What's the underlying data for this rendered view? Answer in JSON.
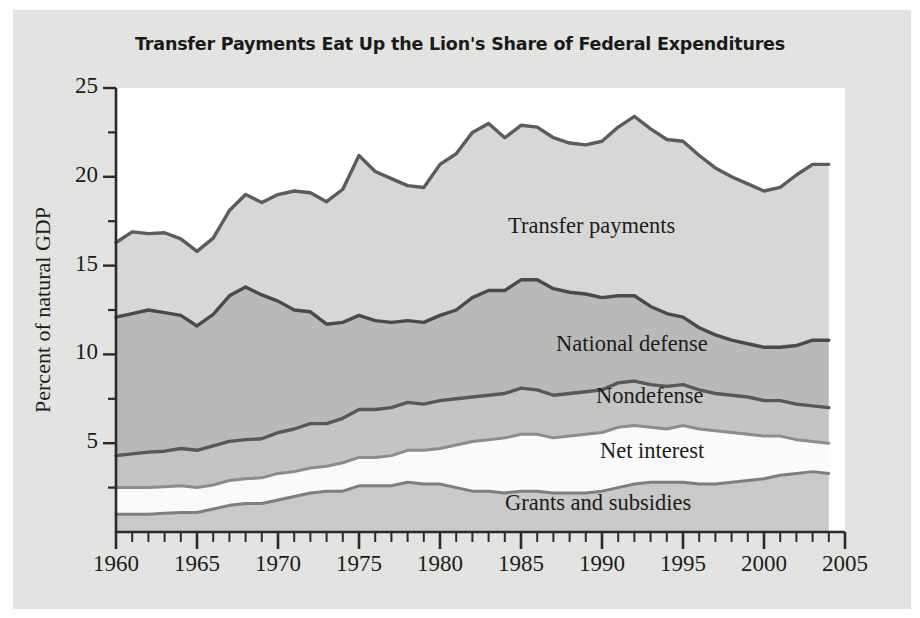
{
  "figure": {
    "title": "Transfer Payments Eat Up the Lion's Share of Federal Expenditures"
  },
  "axes": {
    "ylabel": "Percent of natural GDP",
    "yticks": [
      "5",
      "10",
      "15",
      "20",
      "25"
    ],
    "xticks": [
      "1960",
      "1965",
      "1970",
      "1975",
      "1980",
      "1985",
      "1990",
      "1995",
      "2000",
      "2005"
    ]
  },
  "series_labels": {
    "transfer": "Transfer payments",
    "defense": "National defense",
    "nondefense": "Nondefense",
    "interest": "Net interest",
    "grants": "Grants and subsidies"
  },
  "chart_data": {
    "type": "area",
    "title": "Transfer Payments Eat Up the Lion's Share of Federal Expenditures",
    "xlabel": "",
    "ylabel": "Percent of natural GDP",
    "xlim": [
      1960,
      2005
    ],
    "ylim": [
      0,
      25
    ],
    "grid": false,
    "legend": "inline-labels",
    "stacked": true,
    "x": [
      1960,
      1961,
      1962,
      1963,
      1964,
      1965,
      1966,
      1967,
      1968,
      1969,
      1970,
      1971,
      1972,
      1973,
      1974,
      1975,
      1976,
      1977,
      1978,
      1979,
      1980,
      1981,
      1982,
      1983,
      1984,
      1985,
      1986,
      1987,
      1988,
      1989,
      1990,
      1991,
      1992,
      1993,
      1994,
      1995,
      1996,
      1997,
      1998,
      1999,
      2000,
      2001,
      2002,
      2003,
      2004
    ],
    "series": [
      {
        "name": "Grants and subsidies",
        "order": 1,
        "color": "#c9c9c7",
        "line_color": "#7e7e7e",
        "values": [
          1.0,
          1.0,
          1.0,
          1.05,
          1.1,
          1.1,
          1.3,
          1.5,
          1.6,
          1.6,
          1.8,
          2.0,
          2.2,
          2.3,
          2.3,
          2.6,
          2.6,
          2.6,
          2.8,
          2.7,
          2.7,
          2.5,
          2.3,
          2.3,
          2.2,
          2.3,
          2.3,
          2.2,
          2.2,
          2.2,
          2.3,
          2.5,
          2.7,
          2.8,
          2.8,
          2.8,
          2.7,
          2.7,
          2.8,
          2.9,
          3.0,
          3.2,
          3.3,
          3.4,
          3.3
        ]
      },
      {
        "name": "Net interest",
        "order": 2,
        "color": "#fafafa",
        "line_color": "#8c8c8c",
        "values": [
          1.5,
          1.5,
          1.5,
          1.5,
          1.5,
          1.4,
          1.35,
          1.4,
          1.4,
          1.45,
          1.5,
          1.4,
          1.4,
          1.4,
          1.6,
          1.6,
          1.6,
          1.7,
          1.8,
          1.9,
          2.0,
          2.4,
          2.8,
          2.9,
          3.1,
          3.2,
          3.2,
          3.1,
          3.2,
          3.3,
          3.3,
          3.4,
          3.3,
          3.1,
          3.0,
          3.2,
          3.1,
          3.0,
          2.8,
          2.6,
          2.4,
          2.2,
          1.9,
          1.7,
          1.7
        ]
      },
      {
        "name": "Nondefense",
        "order": 3,
        "color": "#c4c4c2",
        "line_color": "#585858",
        "values": [
          1.8,
          1.9,
          2.0,
          2.0,
          2.1,
          2.1,
          2.2,
          2.2,
          2.2,
          2.2,
          2.3,
          2.4,
          2.5,
          2.4,
          2.5,
          2.7,
          2.7,
          2.7,
          2.7,
          2.6,
          2.7,
          2.6,
          2.5,
          2.5,
          2.5,
          2.6,
          2.5,
          2.4,
          2.4,
          2.4,
          2.4,
          2.5,
          2.5,
          2.4,
          2.4,
          2.3,
          2.2,
          2.1,
          2.1,
          2.1,
          2.0,
          2.0,
          2.0,
          2.0,
          2.0
        ]
      },
      {
        "name": "National defense",
        "order": 4,
        "color": "#b9b9b7",
        "line_color": "#4a4a4a",
        "values": [
          7.8,
          7.9,
          8.0,
          7.8,
          7.5,
          7.0,
          7.4,
          8.2,
          8.6,
          8.1,
          7.4,
          6.7,
          6.3,
          5.6,
          5.4,
          5.3,
          5.0,
          4.8,
          4.6,
          4.6,
          4.8,
          5.0,
          5.6,
          5.9,
          5.8,
          6.1,
          6.2,
          6.0,
          5.7,
          5.5,
          5.2,
          4.9,
          4.8,
          4.4,
          4.1,
          3.8,
          3.5,
          3.3,
          3.1,
          3.0,
          3.0,
          3.0,
          3.3,
          3.7,
          3.8
        ]
      },
      {
        "name": "Transfer payments",
        "order": 5,
        "color": "#d7d7d5",
        "line_color": "#5c5c5c",
        "values": [
          4.2,
          4.6,
          4.3,
          4.5,
          4.3,
          4.2,
          4.3,
          4.8,
          5.2,
          5.2,
          6.0,
          6.7,
          6.7,
          6.9,
          7.5,
          9.0,
          8.4,
          8.1,
          7.6,
          7.6,
          8.5,
          8.8,
          9.3,
          9.4,
          8.6,
          8.7,
          8.6,
          8.5,
          8.4,
          8.4,
          8.8,
          9.5,
          10.1,
          10.0,
          9.8,
          9.9,
          9.7,
          9.4,
          9.2,
          9.0,
          8.8,
          9.0,
          9.6,
          9.9,
          9.9
        ]
      }
    ],
    "cumulative_tops": {
      "grants": [
        1.0,
        1.0,
        1.0,
        1.05,
        1.1,
        1.1,
        1.3,
        1.5,
        1.6,
        1.6,
        1.8,
        2.0,
        2.2,
        2.3,
        2.3,
        2.6,
        2.6,
        2.6,
        2.8,
        2.7,
        2.7,
        2.5,
        2.3,
        2.3,
        2.2,
        2.3,
        2.3,
        2.2,
        2.2,
        2.2,
        2.3,
        2.5,
        2.7,
        2.8,
        2.8,
        2.8,
        2.7,
        2.7,
        2.8,
        2.9,
        3.0,
        3.2,
        3.3,
        3.4,
        3.3
      ],
      "interest": [
        2.5,
        2.5,
        2.5,
        2.55,
        2.6,
        2.5,
        2.65,
        2.9,
        3.0,
        3.05,
        3.3,
        3.4,
        3.6,
        3.7,
        3.9,
        4.2,
        4.2,
        4.3,
        4.6,
        4.6,
        4.7,
        4.9,
        5.1,
        5.2,
        5.3,
        5.5,
        5.5,
        5.3,
        5.4,
        5.5,
        5.6,
        5.9,
        6.0,
        5.9,
        5.8,
        6.0,
        5.8,
        5.7,
        5.6,
        5.5,
        5.4,
        5.4,
        5.2,
        5.1,
        5.0
      ],
      "nondefense": [
        4.3,
        4.4,
        4.5,
        4.55,
        4.7,
        4.6,
        4.85,
        5.1,
        5.2,
        5.25,
        5.6,
        5.8,
        6.1,
        6.1,
        6.4,
        6.9,
        6.9,
        7.0,
        7.3,
        7.2,
        7.4,
        7.5,
        7.6,
        7.7,
        7.8,
        8.1,
        8.0,
        7.7,
        7.8,
        7.9,
        8.0,
        8.4,
        8.5,
        8.3,
        8.2,
        8.3,
        8.0,
        7.8,
        7.7,
        7.6,
        7.4,
        7.4,
        7.2,
        7.1,
        7.0
      ],
      "defense": [
        12.1,
        12.3,
        12.5,
        12.35,
        12.2,
        11.6,
        12.25,
        13.3,
        13.8,
        13.35,
        13.0,
        12.5,
        12.4,
        11.7,
        11.8,
        12.2,
        11.9,
        11.8,
        11.9,
        11.8,
        12.2,
        12.5,
        13.2,
        13.6,
        13.6,
        14.2,
        14.2,
        13.7,
        13.5,
        13.4,
        13.2,
        13.3,
        13.3,
        12.7,
        12.3,
        12.1,
        11.5,
        11.1,
        10.8,
        10.6,
        10.4,
        10.4,
        10.5,
        10.8,
        10.8
      ],
      "transfer": [
        16.3,
        16.9,
        16.8,
        16.85,
        16.5,
        15.8,
        16.55,
        18.1,
        19.0,
        18.55,
        19.0,
        19.2,
        19.1,
        18.6,
        19.3,
        21.2,
        20.3,
        19.9,
        19.5,
        19.4,
        20.7,
        21.3,
        22.5,
        23.0,
        22.2,
        22.9,
        22.8,
        22.2,
        21.9,
        21.8,
        22.0,
        22.8,
        23.4,
        22.7,
        22.1,
        22.0,
        21.2,
        20.5,
        20.0,
        19.6,
        19.2,
        19.4,
        20.1,
        20.7,
        20.7
      ]
    }
  }
}
